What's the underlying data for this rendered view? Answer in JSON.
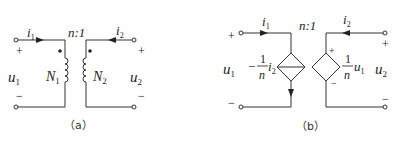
{
  "diagram_a": {
    "caption": "（a）",
    "ratio_label": "n:1",
    "i1": {
      "sym": "i",
      "sub": "1"
    },
    "i2": {
      "sym": "i",
      "sub": "2"
    },
    "u1": {
      "sym": "u",
      "sub": "1"
    },
    "u2": {
      "sym": "u",
      "sub": "2"
    },
    "N1": {
      "sym": "N",
      "sub": "1"
    },
    "N2": {
      "sym": "N",
      "sub": "2"
    },
    "plus": "+",
    "minus": "−"
  },
  "diagram_b": {
    "caption": "（b）",
    "ratio_label": "n:1",
    "i1": {
      "sym": "i",
      "sub": "1"
    },
    "i2": {
      "sym": "i",
      "sub": "2"
    },
    "u1": {
      "sym": "u",
      "sub": "1"
    },
    "u2": {
      "sym": "u",
      "sub": "2"
    },
    "ccs_label": {
      "sign": "−",
      "num": "1",
      "den": "n",
      "var": "i",
      "var_sub": "2"
    },
    "vcvs_label": {
      "num": "1",
      "den": "n",
      "var": "u",
      "var_sub": "1"
    },
    "plus": "+",
    "minus": "−"
  },
  "colors": {
    "line": "#333333",
    "background": "#ffffff"
  }
}
